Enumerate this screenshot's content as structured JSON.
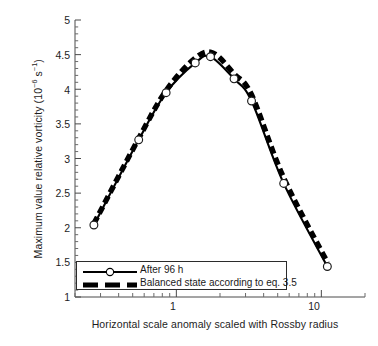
{
  "chart_data": {
    "type": "line",
    "title": "",
    "xlabel": "Horizontal scale anomaly scaled with Rossby radius",
    "ylabel": "Maximum value relative vorticity (10-6 s-1)",
    "ylabel_parts": {
      "text": "Maximum value relative vorticity (10",
      "exp1": "−6",
      "mid": " s",
      "exp2": "−1",
      "tail": ")"
    },
    "xscale": "log",
    "yscale": "linear",
    "xlim": [
      0.2,
      20
    ],
    "ylim": [
      1,
      5
    ],
    "grid": false,
    "legend_position": "lower-left-inside",
    "x_tick_labels": [
      "1",
      "10"
    ],
    "x_tick_values": [
      1,
      10
    ],
    "y_tick_labels": [
      "1",
      "1.5",
      "2",
      "2.5",
      "3",
      "3.5",
      "4",
      "4.5",
      "5"
    ],
    "y_tick_values": [
      1,
      1.5,
      2,
      2.5,
      3,
      3.5,
      4,
      4.5,
      5
    ],
    "series": [
      {
        "name": "After 96 h",
        "style": "solid-with-open-circles",
        "color": "#000000",
        "x": [
          0.27,
          0.55,
          0.85,
          1.35,
          1.72,
          2.5,
          3.3,
          5.5,
          11.0
        ],
        "y": [
          2.04,
          3.27,
          3.95,
          4.38,
          4.47,
          4.15,
          3.83,
          2.64,
          1.44
        ]
      },
      {
        "name": "Balanced state according to eq. 3.5",
        "style": "thick-dashed",
        "color": "#000000",
        "x": [
          0.27,
          0.55,
          0.85,
          1.35,
          1.8,
          2.5,
          3.3,
          5.5,
          11.0
        ],
        "y": [
          2.06,
          3.29,
          3.98,
          4.45,
          4.52,
          4.22,
          3.92,
          2.72,
          1.5
        ]
      }
    ]
  },
  "legend": {
    "items": [
      {
        "label": "After 96 h",
        "key": "line-marker-key"
      },
      {
        "label": "Balanced state according to eq. 3.5",
        "key": "dashed-line-key"
      }
    ]
  },
  "axes": {
    "x_labels": [
      {
        "text": "1",
        "left": 158,
        "top": 300
      },
      {
        "text": "10",
        "left": 299,
        "top": 300
      }
    ],
    "y_labels": [
      {
        "text": "5",
        "top": 15
      },
      {
        "text": "4.5",
        "top": 50
      },
      {
        "text": "4",
        "top": 85
      },
      {
        "text": "3.5",
        "top": 119
      },
      {
        "text": "3",
        "top": 154
      },
      {
        "text": "2.5",
        "top": 188
      },
      {
        "text": "2",
        "top": 223
      },
      {
        "text": "1.5",
        "top": 257
      },
      {
        "text": "1",
        "top": 292
      }
    ]
  }
}
